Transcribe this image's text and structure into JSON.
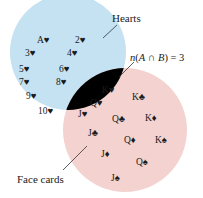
{
  "diagram": {
    "type": "venn",
    "sets": {
      "A": {
        "label": "Hearts",
        "color": "#c4e2f2"
      },
      "B": {
        "label": "Face cards",
        "color": "#f3d2d0"
      },
      "intersection_color": "#b8b0bd"
    },
    "annotation": "n(A ∩ B) = 3",
    "annotation_parts": {
      "n": "n",
      "paren_open": "(",
      "A": "A",
      "cap": " ∩ ",
      "B": "B",
      "paren_close": ")",
      "eq": " = 3"
    },
    "only_A": [
      "A♥",
      "2♥",
      "3♥",
      "4♥",
      "5♥",
      "6♥",
      "7♥",
      "8♥",
      "9♥",
      "10♥"
    ],
    "A_and_B": [
      "K♥",
      "Q♥",
      "J♥"
    ],
    "only_B": [
      "K♣",
      "Q♣",
      "K♦",
      "J♣",
      "Q♦",
      "K♠",
      "J♦",
      "Q♠",
      "J♠"
    ]
  }
}
